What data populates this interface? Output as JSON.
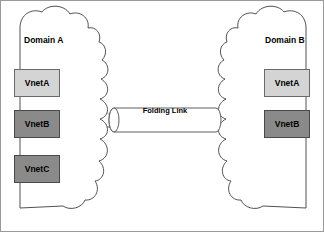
{
  "diagram": {
    "type": "network-topology",
    "background_color": "#ffffff",
    "frame": {
      "border_color": "#9a9a9a",
      "border_width": 1
    },
    "domains": [
      {
        "id": "domain-a",
        "label": "Domain A",
        "side": "left",
        "outline_color": "#3d3d3d",
        "fill_color": "#ffffff",
        "nodes": [
          {
            "id": "domain-a-vneta",
            "label": "VnetA",
            "fill_color": "#d4d4d4",
            "border_color": "#6a6a6a",
            "text_color": "#000000"
          },
          {
            "id": "domain-a-vnetb",
            "label": "VnetB",
            "fill_color": "#8a8a8a",
            "border_color": "#4a4a4a",
            "text_color": "#000000"
          },
          {
            "id": "domain-a-vnetc",
            "label": "VnetC",
            "fill_color": "#8a8a8a",
            "border_color": "#4a4a4a",
            "text_color": "#000000"
          }
        ]
      },
      {
        "id": "domain-b",
        "label": "Domain B",
        "side": "right",
        "outline_color": "#3d3d3d",
        "fill_color": "#ffffff",
        "nodes": [
          {
            "id": "domain-b-vneta",
            "label": "VnetA",
            "fill_color": "#d4d4d4",
            "border_color": "#6a6a6a",
            "text_color": "#000000"
          },
          {
            "id": "domain-b-vnetb",
            "label": "VnetB",
            "fill_color": "#8a8a8a",
            "border_color": "#4a4a4a",
            "text_color": "#000000"
          }
        ]
      }
    ],
    "link": {
      "id": "folding-link",
      "label": "Folding Link",
      "shape": "cylinder",
      "fill_color": "#ffffff",
      "outline_color": "#4a4a4a"
    },
    "connections": [
      {
        "id": "connection-vneta",
        "from": "domain-a-vneta",
        "to": "domain-b-vneta",
        "color": "#c8c8c8",
        "style": "curved"
      },
      {
        "id": "connection-vnetb",
        "from": "domain-a-vnetb",
        "to": "domain-b-vnetb",
        "color": "#6a6a6a",
        "style": "straight"
      }
    ]
  }
}
